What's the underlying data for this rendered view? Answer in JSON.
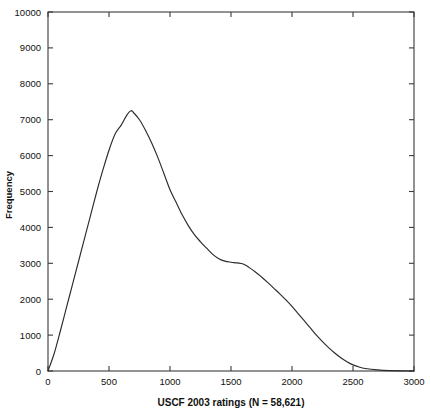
{
  "chart_data": {
    "type": "line",
    "title": "",
    "xlabel": "USCF 2003 ratings (N = 58,621)",
    "ylabel": "Frequency",
    "xlim": [
      0,
      3000
    ],
    "ylim": [
      0,
      10000
    ],
    "xticks": [
      0,
      500,
      1000,
      1500,
      2000,
      2500,
      3000
    ],
    "yticks": [
      0,
      1000,
      2000,
      3000,
      4000,
      5000,
      6000,
      7000,
      8000,
      9000,
      10000
    ],
    "xtick_labels": [
      "0",
      "500",
      "1000",
      "1500",
      "2000",
      "2500",
      "3000"
    ],
    "ytick_labels": [
      "0",
      "1000",
      "2000",
      "3000",
      "4000",
      "5000",
      "6000",
      "7000",
      "8000",
      "9000",
      "10000"
    ],
    "grid": false,
    "legend": "none",
    "sample_size": "58,621",
    "series": [
      {
        "name": "USCF 2003 rating frequency",
        "x": [
          0,
          50,
          100,
          150,
          200,
          250,
          300,
          350,
          400,
          450,
          500,
          550,
          600,
          650,
          680,
          700,
          750,
          800,
          850,
          900,
          950,
          1000,
          1050,
          1100,
          1150,
          1200,
          1250,
          1300,
          1350,
          1400,
          1450,
          1500,
          1550,
          1600,
          1650,
          1700,
          1750,
          1800,
          1850,
          1900,
          1950,
          2000,
          2050,
          2100,
          2150,
          2200,
          2250,
          2300,
          2350,
          2400,
          2450,
          2500,
          2550,
          2600,
          2700,
          2800,
          3000
        ],
        "y": [
          0,
          480,
          1100,
          1750,
          2400,
          3050,
          3700,
          4350,
          5000,
          5600,
          6150,
          6600,
          6850,
          7150,
          7250,
          7200,
          7000,
          6700,
          6350,
          5950,
          5500,
          5050,
          4700,
          4350,
          4050,
          3800,
          3600,
          3420,
          3250,
          3130,
          3060,
          3030,
          3010,
          2980,
          2880,
          2760,
          2620,
          2470,
          2310,
          2150,
          1980,
          1800,
          1600,
          1400,
          1200,
          1000,
          820,
          650,
          500,
          370,
          260,
          170,
          110,
          70,
          30,
          12,
          0
        ]
      }
    ],
    "annotations": {
      "peak_rating": 680,
      "peak_frequency": 7250,
      "shoulder_rating": 1500,
      "shoulder_frequency": 3030
    }
  },
  "axes": {
    "frame_color": "#3a3a3a",
    "curve_color": "#2b2b2b",
    "background": "#ffffff"
  }
}
